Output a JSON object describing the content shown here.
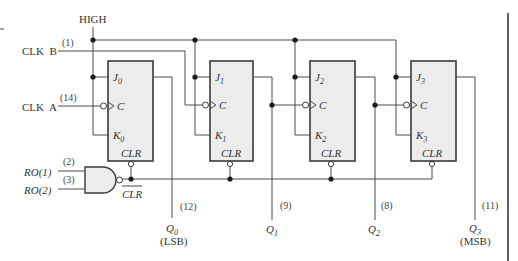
{
  "diagram": {
    "type": "logic-circuit",
    "labels": {
      "high": "HIGH",
      "clk_b": "CLK  B",
      "clk_b_pin": "(1)",
      "clk_a": "CLK  A",
      "clk_a_pin": "(14)",
      "ro1": "RO(1)",
      "ro1_pin": "(2)",
      "ro2": "RO(2)",
      "ro2_pin": "(3)",
      "clr_bar": "CLR"
    },
    "flip_flops": [
      {
        "j": "J",
        "k": "K",
        "index": "0",
        "c": "C",
        "clr": "CLR"
      },
      {
        "j": "J",
        "k": "K",
        "index": "1",
        "c": "C",
        "clr": "CLR"
      },
      {
        "j": "J",
        "k": "K",
        "index": "2",
        "c": "C",
        "clr": "CLR"
      },
      {
        "j": "J",
        "k": "K",
        "index": "3",
        "c": "C",
        "clr": "CLR"
      }
    ],
    "outputs": [
      {
        "name": "Q",
        "index": "0",
        "pin": "(12)",
        "note": "(LSB)"
      },
      {
        "name": "Q",
        "index": "1",
        "pin": "(9)",
        "note": ""
      },
      {
        "name": "Q",
        "index": "2",
        "pin": "(8)",
        "note": ""
      },
      {
        "name": "Q",
        "index": "3",
        "pin": "(11)",
        "note": "(MSB)"
      }
    ],
    "gate": {
      "type": "NAND",
      "inputs": 2
    }
  }
}
